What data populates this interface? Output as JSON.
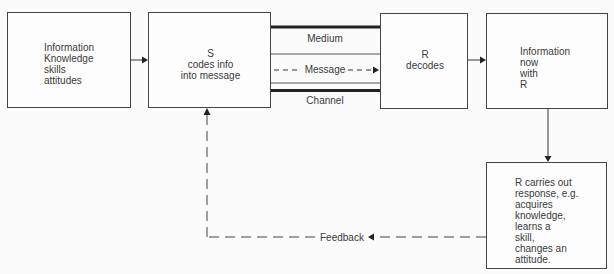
{
  "diagram": {
    "title": "",
    "nodes": [
      {
        "id": "source",
        "label": "Information\nKnowledge\nskills\nattitudes"
      },
      {
        "id": "sender",
        "label": "S\ncodes info\ninto message"
      },
      {
        "id": "receiver",
        "label": "R\ndecodes"
      },
      {
        "id": "result",
        "label": "Information\nnow\nwith\nR"
      },
      {
        "id": "response",
        "label": "R carries out\nresponse, e.g.\nacquires\nknowledge,\nlearns a\nskill,\nchanges an\nattitude."
      }
    ],
    "channel": {
      "top_label": "Medium",
      "middle_label": "Message",
      "bottom_label": "Channel"
    },
    "feedback": {
      "label": "Feedback"
    },
    "edges": [
      {
        "from": "source",
        "to": "sender",
        "style": "solid"
      },
      {
        "from": "sender",
        "to": "receiver",
        "style": "dashed",
        "label": "Message"
      },
      {
        "from": "receiver",
        "to": "result",
        "style": "solid"
      },
      {
        "from": "result",
        "to": "response",
        "style": "solid"
      },
      {
        "from": "response",
        "to": "sender",
        "style": "dashed",
        "label": "Feedback"
      }
    ]
  }
}
